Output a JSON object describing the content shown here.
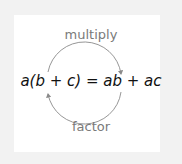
{
  "diagram": {
    "top_label": "multiply",
    "bottom_label": "factor",
    "equation": "a(b + c) = ab + ac",
    "colors": {
      "frame": "#f2f2f2",
      "panel": "#ffffff",
      "arrow": "#8a8a8a",
      "label": "#7a7a7a",
      "equation": "#111111"
    }
  }
}
